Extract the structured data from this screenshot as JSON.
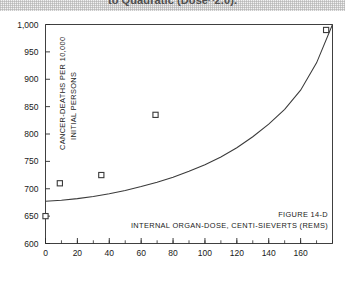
{
  "caption": {
    "top_text": "to Quadratic (Dose^2.0)."
  },
  "figure": {
    "number_label": "Figure 14-D"
  },
  "chart_data": {
    "type": "line",
    "title": "",
    "subtitle": "",
    "xlabel": "Internal Organ-Dose, centi-sieverts (rems)",
    "ylabel_line1": "Cancer-Deaths per 10,000",
    "ylabel_line2": "Initial Persons",
    "ylabel": "Cancer-Deaths per 10,000 Initial Persons",
    "xlim": [
      0,
      180
    ],
    "ylim": [
      600,
      1000
    ],
    "xticks": [
      0,
      20,
      40,
      60,
      80,
      100,
      120,
      140,
      160
    ],
    "xtick_labels": [
      "0",
      "20",
      "40",
      "60",
      "80",
      "100",
      "120",
      "140",
      "160"
    ],
    "xminor_step": 10,
    "yticks": [
      600,
      650,
      700,
      750,
      800,
      850,
      900,
      950,
      1000
    ],
    "ytick_labels": [
      "600",
      "650",
      "700",
      "750",
      "800",
      "850",
      "900",
      "950",
      "1,000"
    ],
    "grid": false,
    "legend": "none",
    "series": [
      {
        "name": "Quadratic fit curve",
        "type": "line",
        "color": "#3a3a3a",
        "x": [
          0,
          10,
          20,
          30,
          40,
          50,
          60,
          70,
          80,
          90,
          100,
          110,
          120,
          130,
          140,
          150,
          160,
          170,
          180
        ],
        "y": [
          677,
          679,
          682,
          686,
          691,
          697,
          704,
          712,
          721,
          732,
          744,
          758,
          775,
          795,
          818,
          845,
          880,
          930,
          1000
        ]
      },
      {
        "name": "Observed data points",
        "type": "scatter",
        "marker": "open-square",
        "color": "#3a3a3a",
        "points": [
          {
            "x": 0,
            "y": 650
          },
          {
            "x": 9,
            "y": 710
          },
          {
            "x": 35,
            "y": 725
          },
          {
            "x": 69,
            "y": 835
          },
          {
            "x": 176,
            "y": 990
          }
        ]
      }
    ]
  }
}
